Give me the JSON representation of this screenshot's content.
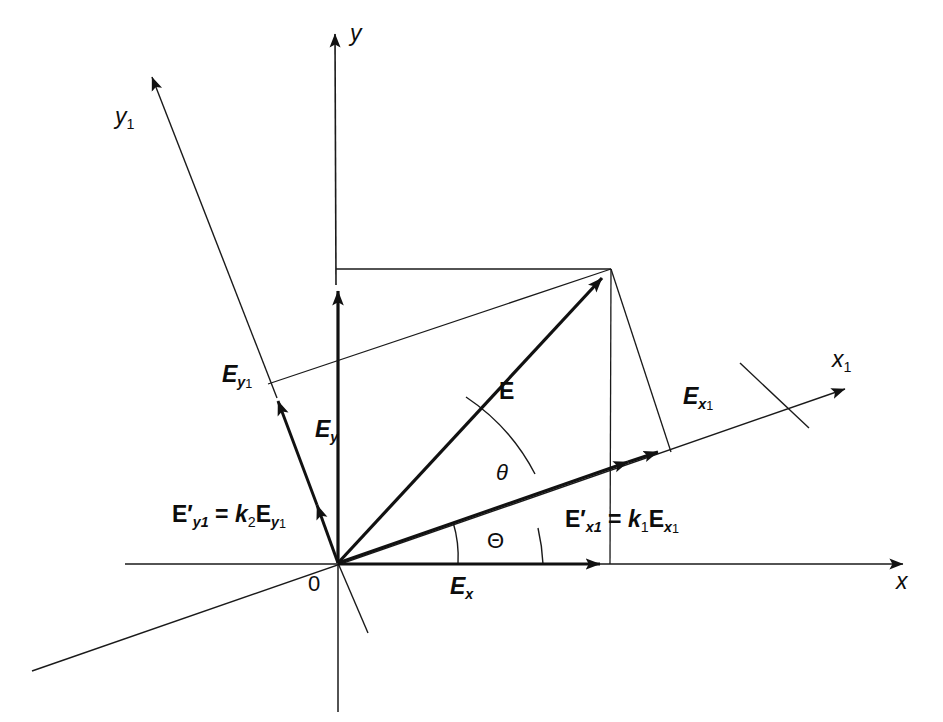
{
  "figure": {
    "type": "vector-decomposition-diagram",
    "background_color": "#ffffff",
    "stroke_color": "#1a1a1a"
  },
  "axes": {
    "x": {
      "label": "x",
      "label_x": 896,
      "label_y": 570
    },
    "y": {
      "label": "y",
      "label_x": 350,
      "label_y": 22
    },
    "x1": {
      "label": "x",
      "sub": "1",
      "label_x": 832,
      "label_y": 348
    },
    "y1": {
      "label": "y",
      "sub": "1",
      "label_x": 115,
      "label_y": 105
    }
  },
  "origin": {
    "label": "0",
    "label_x": 308,
    "label_y": 573
  },
  "angles": [
    {
      "name": "theta-lower",
      "glyph": "Θ",
      "label_x": 487,
      "label_y": 530,
      "between": "x-axis and x1-axis"
    },
    {
      "name": "theta-upper",
      "glyph": "θ",
      "label_x": 496,
      "label_y": 462,
      "between": "x1-axis and E vector"
    }
  ],
  "vectors": [
    {
      "name": "E",
      "label": "E",
      "sub": "",
      "label_x": 499,
      "label_y": 380
    },
    {
      "name": "Ex",
      "label": "E",
      "sub": "x",
      "label_x": 450,
      "label_y": 575
    },
    {
      "name": "Ey",
      "label": "E",
      "sub": "y",
      "label_x": 315,
      "label_y": 418
    },
    {
      "name": "Ex1",
      "label": "E",
      "sub": "x",
      "sub2": "1",
      "label_x": 683,
      "label_y": 385
    },
    {
      "name": "Ey1",
      "label": "E",
      "sub": "y",
      "sub2": "1",
      "label_x": 222,
      "label_y": 363
    }
  ],
  "equations": [
    {
      "name": "E-prime-y1-equation",
      "text": "E′y1 = k2Ey1",
      "parts": {
        "lhs": "E",
        "lhs_prime": "′",
        "lhs_sub": "y1",
        "eq": "=",
        "coef": "k",
        "coef_sub": "2",
        "rhs": "E",
        "rhs_sub": "y",
        "rhs_sub2": "1"
      },
      "label_x": 172,
      "label_y": 503
    },
    {
      "name": "E-prime-x1-equation",
      "text": "E′x1 = k1Ex1",
      "parts": {
        "lhs": "E",
        "lhs_prime": "′",
        "lhs_sub": "x1",
        "eq": "=",
        "coef": "k",
        "coef_sub": "1",
        "rhs": "E",
        "rhs_sub": "x",
        "rhs_sub2": "1"
      },
      "label_x": 565,
      "label_y": 508
    }
  ],
  "geometry": {
    "origin_px": [
      338,
      563
    ],
    "E_tip_px": [
      611,
      269
    ],
    "x_axis": {
      "from": [
        125,
        564
      ],
      "to": [
        918,
        564
      ]
    },
    "y_axis": {
      "from": [
        338,
        712
      ],
      "to": [
        335,
        22
      ]
    },
    "x1_axis": {
      "from": [
        32,
        671
      ],
      "to": [
        856,
        386
      ]
    },
    "y1_axis": {
      "from": [
        368,
        633
      ],
      "to": [
        143,
        66
      ]
    },
    "Ey_tip_px": [
      338,
      277
    ],
    "Ex_tip_px": [
      609,
      564
    ],
    "Ey1_tip_px": [
      272,
      387
    ],
    "Eprime_y1_tip_px": [
      312,
      491
    ],
    "Ex1_tip_px": [
      666,
      452
    ],
    "Eprime_x1_tip_px": [
      636,
      465
    ]
  }
}
